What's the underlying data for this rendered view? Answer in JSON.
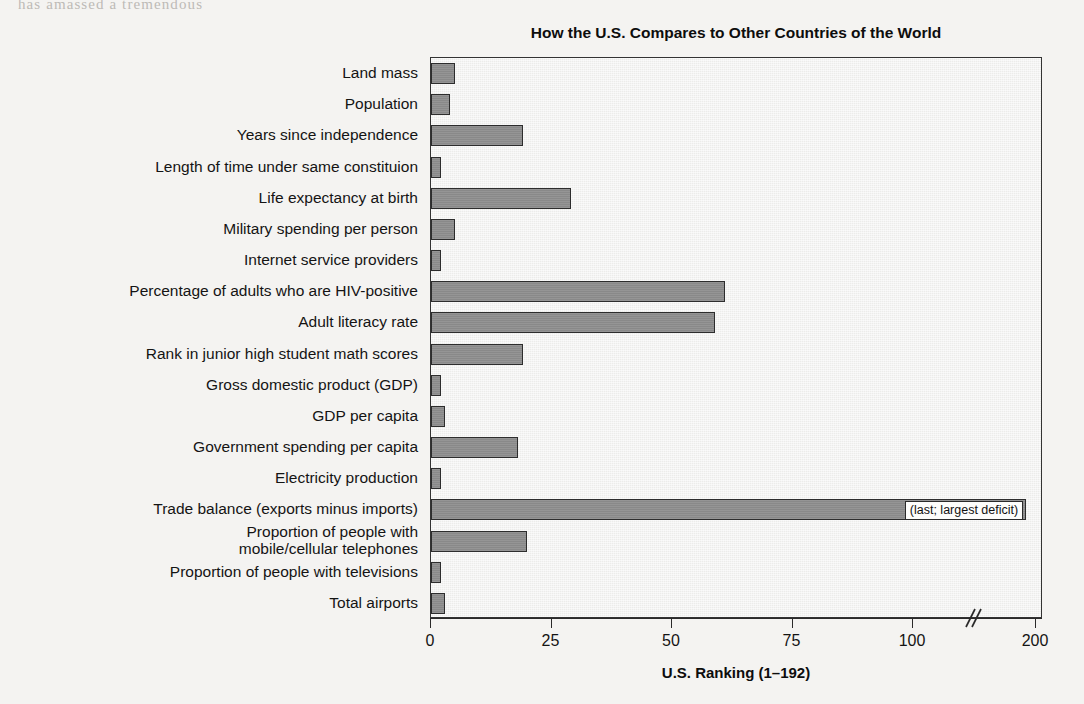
{
  "page_bleed_text": "has amassed a tremendous",
  "chart_data": {
    "type": "bar",
    "orientation": "horizontal",
    "title": "How the U.S. Compares to Other Countries of the World",
    "xlabel": "U.S. Ranking (1–192)",
    "ylabel": "",
    "grid": false,
    "legend": null,
    "xlim": [
      0,
      200
    ],
    "axis_break": {
      "present": true,
      "between": [
        100,
        200
      ],
      "glyph": "//"
    },
    "xticks": [
      0,
      25,
      50,
      75,
      100,
      200
    ],
    "xtick_labels": [
      "0",
      "25",
      "50",
      "75",
      "100",
      "200"
    ],
    "bar_color": "#8d8d8d",
    "bar_edge_color": "#2d2d2d",
    "plot_background": "#ececea",
    "categories": [
      "Land mass",
      "Population",
      "Years since independence",
      "Length of time under same constituion",
      "Life expectancy at birth",
      "Military spending per person",
      "Internet service providers",
      "Percentage of adults who are HIV-positive",
      "Adult literacy rate",
      "Rank in junior high student math scores",
      "Gross domestic product (GDP)",
      "GDP per capita",
      "Government spending per capita",
      "Electricity production",
      "Trade balance (exports minus imports)",
      "Proportion of people with\nmobile/cellular telephones",
      "Proportion of people with televisions",
      "Total airports"
    ],
    "values": [
      5,
      4,
      19,
      2,
      29,
      5,
      2,
      61,
      59,
      19,
      2,
      3,
      18,
      2,
      192,
      20,
      2,
      3
    ],
    "annotations": [
      {
        "category": "Trade balance (exports minus imports)",
        "index": 14,
        "text": "(last; largest deficit)"
      }
    ]
  }
}
